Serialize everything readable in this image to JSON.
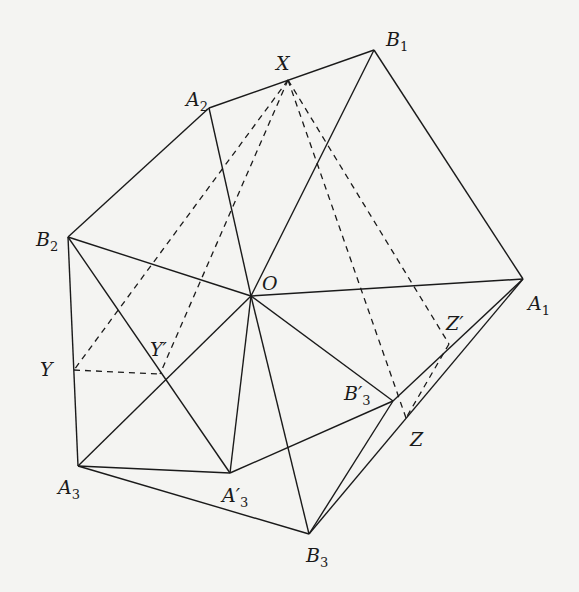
{
  "diagram": {
    "type": "geometric-construction",
    "points": {
      "O": {
        "label": "O",
        "sub": "",
        "x": 251,
        "y": 296,
        "lx": 262,
        "ly": 290
      },
      "A1": {
        "label": "A",
        "sub": "1",
        "x": 523,
        "y": 279,
        "lx": 528,
        "ly": 310
      },
      "A2": {
        "label": "A",
        "sub": "2",
        "x": 209,
        "y": 108,
        "lx": 186,
        "ly": 106
      },
      "A3": {
        "label": "A",
        "sub": "3",
        "x": 78,
        "y": 466,
        "lx": 58,
        "ly": 494
      },
      "A3p": {
        "label": "A′",
        "sub": "3",
        "x": 230,
        "y": 473,
        "lx": 222,
        "ly": 502
      },
      "B1": {
        "label": "B",
        "sub": "1",
        "x": 374,
        "y": 50,
        "lx": 386,
        "ly": 46
      },
      "B2": {
        "label": "B",
        "sub": "2",
        "x": 68,
        "y": 237,
        "lx": 36,
        "ly": 246
      },
      "B3": {
        "label": "B",
        "sub": "3",
        "x": 309,
        "y": 534,
        "lx": 306,
        "ly": 562
      },
      "B3p": {
        "label": "B′",
        "sub": "3",
        "x": 393,
        "y": 401,
        "lx": 344,
        "ly": 400
      },
      "X": {
        "label": "X",
        "sub": "",
        "x": 288,
        "y": 80,
        "lx": 276,
        "ly": 70
      },
      "Y": {
        "label": "Y",
        "sub": "",
        "x": 74,
        "y": 370,
        "lx": 40,
        "ly": 376
      },
      "Yp": {
        "label": "Y′",
        "sub": "",
        "x": 160,
        "y": 374,
        "lx": 150,
        "ly": 356
      },
      "Z": {
        "label": "Z",
        "sub": "",
        "x": 406,
        "y": 418,
        "lx": 410,
        "ly": 446
      },
      "Zp": {
        "label": "Z′",
        "sub": "",
        "x": 449,
        "y": 344,
        "lx": 446,
        "ly": 330
      }
    },
    "solid_edges": [
      [
        "A2",
        "B1"
      ],
      [
        "B1",
        "A1"
      ],
      [
        "A2",
        "B2"
      ],
      [
        "B2",
        "A3"
      ],
      [
        "A3",
        "B3"
      ],
      [
        "O",
        "A2"
      ],
      [
        "O",
        "B1"
      ],
      [
        "O",
        "A1"
      ],
      [
        "O",
        "B2"
      ],
      [
        "O",
        "A3"
      ],
      [
        "O",
        "A3p"
      ],
      [
        "O",
        "B3"
      ],
      [
        "O",
        "B3p"
      ],
      [
        "B2",
        "A3p"
      ],
      [
        "A3",
        "A3p"
      ],
      [
        "A3p",
        "B3p"
      ],
      [
        "B3p",
        "A1"
      ],
      [
        "B3",
        "B3p"
      ],
      [
        "B3",
        "A1"
      ]
    ],
    "dashed_edges": [
      [
        "X",
        "Y"
      ],
      [
        "X",
        "Yp"
      ],
      [
        "Y",
        "Yp"
      ],
      [
        "X",
        "Z"
      ],
      [
        "X",
        "Zp"
      ],
      [
        "Zp",
        "Z"
      ]
    ]
  }
}
